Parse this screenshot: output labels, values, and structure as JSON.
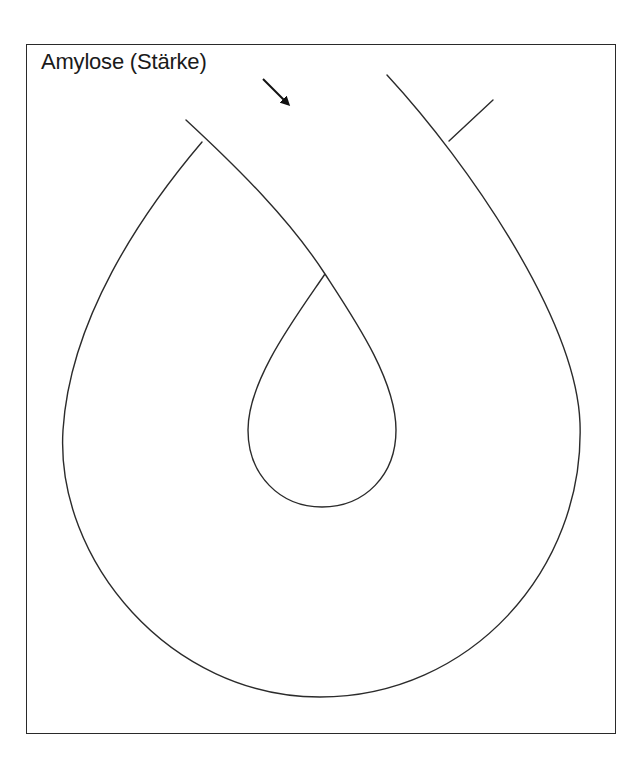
{
  "diagram": {
    "title": "Amylose (Stärke)",
    "elements": [
      {
        "name": "outer-chain",
        "description": "outer strand looping around"
      },
      {
        "name": "inner-chain",
        "description": "inner strand forming teardrop loop"
      },
      {
        "name": "branch",
        "description": "short side branch on right strand"
      },
      {
        "name": "pointer-arrow",
        "description": "arrow pointing from label to chain"
      }
    ],
    "colors": {
      "line": "#2b2b2b",
      "background": "#ffffff",
      "text": "#1a1a1a"
    }
  }
}
